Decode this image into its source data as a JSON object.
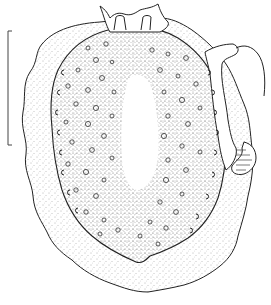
{
  "figure": {
    "scale_bar": {
      "orientation": "vertical",
      "label": ""
    },
    "colors": {
      "ink": "#222222",
      "background": "#ffffff",
      "stipple": "#555555"
    }
  }
}
